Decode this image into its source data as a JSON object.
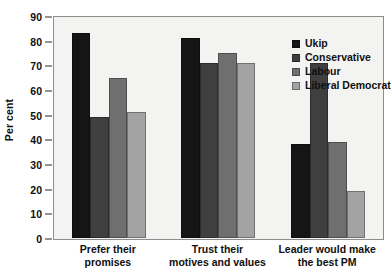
{
  "chart_data": {
    "type": "bar",
    "title": "",
    "subtitle": "",
    "xlabel": "",
    "ylabel": "Per cent",
    "ylim": [
      0,
      90
    ],
    "ytick_step": 10,
    "yticks": [
      0,
      10,
      20,
      30,
      40,
      50,
      60,
      70,
      80,
      90
    ],
    "grid": false,
    "legend_position": "top-right",
    "categories": [
      "Prefer their promises",
      "Trust their motives and values",
      "Leader would make the best PM"
    ],
    "category_lines": [
      [
        "Prefer their",
        "promises"
      ],
      [
        "Trust their",
        "motives and values"
      ],
      [
        "Leader would make",
        "the best PM"
      ]
    ],
    "series": [
      {
        "name": "Ukip",
        "color": "#151515",
        "values": [
          83,
          81,
          38
        ]
      },
      {
        "name": "Conservative",
        "color": "#3f3f3f",
        "values": [
          49,
          71,
          71
        ]
      },
      {
        "name": "Labour",
        "color": "#6f6f6f",
        "values": [
          65,
          75,
          39
        ]
      },
      {
        "name": "Liberal Democrat",
        "color": "#a3a3a3",
        "values": [
          51,
          71,
          19
        ]
      }
    ]
  },
  "axis": {
    "y_title": "Per cent"
  },
  "legend": {
    "items": [
      {
        "label": "Ukip"
      },
      {
        "label": "Conservative"
      },
      {
        "label": "Labour"
      },
      {
        "label": "Liberal Democrat"
      }
    ]
  }
}
